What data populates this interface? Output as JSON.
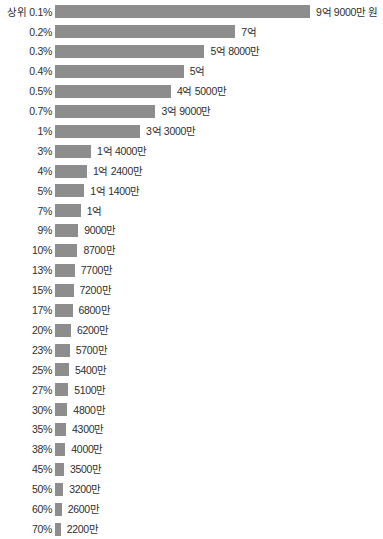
{
  "chart_data": {
    "type": "bar",
    "orientation": "horizontal",
    "title": "",
    "subtitle": "",
    "xlabel": "",
    "ylabel": "",
    "unit_label": "원",
    "grid": false,
    "legend": null,
    "axis_visible": false,
    "bar_color": "#8d8d8d",
    "text_color": "#2e2e2e",
    "background_color": "#ffffff",
    "xlim": [
      0,
      990000000
    ],
    "max_value": 990000000,
    "categories": [
      "상위 0.1%",
      "0.2%",
      "0.3%",
      "0.4%",
      "0.5%",
      "0.7%",
      "1%",
      "3%",
      "4%",
      "5%",
      "7%",
      "9%",
      "10%",
      "13%",
      "15%",
      "17%",
      "20%",
      "23%",
      "25%",
      "27%",
      "30%",
      "35%",
      "38%",
      "45%",
      "50%",
      "60%",
      "70%"
    ],
    "values": [
      990000000,
      700000000,
      580000000,
      500000000,
      450000000,
      390000000,
      330000000,
      140000000,
      124000000,
      114000000,
      100000000,
      90000000,
      87000000,
      77000000,
      72000000,
      68000000,
      62000000,
      57000000,
      54000000,
      51000000,
      48000000,
      43000000,
      40000000,
      35000000,
      32000000,
      26000000,
      22000000
    ],
    "value_labels": [
      "9억 9000만 원",
      "7억",
      "5억 8000만",
      "5억",
      "4억 5000만",
      "3억 9000만",
      "3억 3000만",
      "1억 4000만",
      "1억 2400만",
      "1억 1400만",
      "1억",
      "9000만",
      "8700만",
      "7700만",
      "7200만",
      "6800만",
      "6200만",
      "5700만",
      "5400만",
      "5100만",
      "4800만",
      "4300만",
      "4000만",
      "3500만",
      "3200만",
      "2600만",
      "2200만"
    ],
    "rows": [
      {
        "category": "상위 0.1%",
        "value": 990000000,
        "value_label": "9억 9000만 원"
      },
      {
        "category": "0.2%",
        "value": 700000000,
        "value_label": "7억"
      },
      {
        "category": "0.3%",
        "value": 580000000,
        "value_label": "5억 8000만"
      },
      {
        "category": "0.4%",
        "value": 500000000,
        "value_label": "5억"
      },
      {
        "category": "0.5%",
        "value": 450000000,
        "value_label": "4억 5000만"
      },
      {
        "category": "0.7%",
        "value": 390000000,
        "value_label": "3억 9000만"
      },
      {
        "category": "1%",
        "value": 330000000,
        "value_label": "3억 3000만"
      },
      {
        "category": "3%",
        "value": 140000000,
        "value_label": "1억 4000만"
      },
      {
        "category": "4%",
        "value": 124000000,
        "value_label": "1억 2400만"
      },
      {
        "category": "5%",
        "value": 114000000,
        "value_label": "1억 1400만"
      },
      {
        "category": "7%",
        "value": 100000000,
        "value_label": "1억"
      },
      {
        "category": "9%",
        "value": 90000000,
        "value_label": "9000만"
      },
      {
        "category": "10%",
        "value": 87000000,
        "value_label": "8700만"
      },
      {
        "category": "13%",
        "value": 77000000,
        "value_label": "7700만"
      },
      {
        "category": "15%",
        "value": 72000000,
        "value_label": "7200만"
      },
      {
        "category": "17%",
        "value": 68000000,
        "value_label": "6800만"
      },
      {
        "category": "20%",
        "value": 62000000,
        "value_label": "6200만"
      },
      {
        "category": "23%",
        "value": 57000000,
        "value_label": "5700만"
      },
      {
        "category": "25%",
        "value": 54000000,
        "value_label": "5400만"
      },
      {
        "category": "27%",
        "value": 51000000,
        "value_label": "5100만"
      },
      {
        "category": "30%",
        "value": 48000000,
        "value_label": "4800만"
      },
      {
        "category": "35%",
        "value": 43000000,
        "value_label": "4300만"
      },
      {
        "category": "38%",
        "value": 40000000,
        "value_label": "4000만"
      },
      {
        "category": "45%",
        "value": 35000000,
        "value_label": "3500만"
      },
      {
        "category": "50%",
        "value": 32000000,
        "value_label": "3200만"
      },
      {
        "category": "60%",
        "value": 26000000,
        "value_label": "2600만"
      },
      {
        "category": "70%",
        "value": 22000000,
        "value_label": "2200만"
      }
    ]
  }
}
